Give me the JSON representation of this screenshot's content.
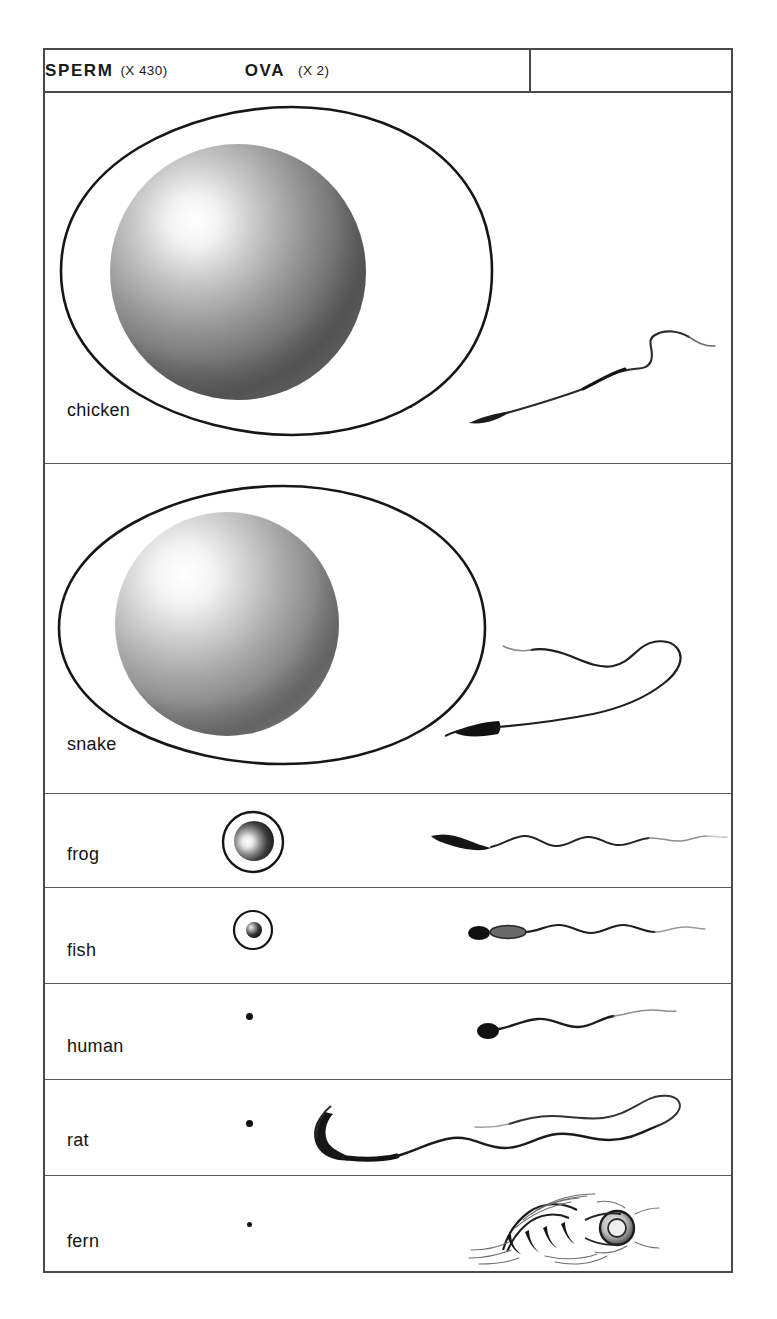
{
  "plate": {
    "header": {
      "ova": {
        "title": "OVA",
        "magnification": "(X 2)",
        "x_symbol": "X",
        "mag_value": "2"
      },
      "sperm": {
        "title": "SPERM",
        "magnification": "(X 430)",
        "x_symbol": "X",
        "mag_value": "430"
      }
    },
    "annotations": {
      "chicken_actual_size": "X 1"
    },
    "rows": [
      {
        "label": "chicken",
        "ovum_type": "egg-outline-with-yolk",
        "sperm_type": "wavy-long-tail"
      },
      {
        "label": "snake",
        "ovum_type": "egg-outline-with-yolk",
        "sperm_type": "looping-long-tail"
      },
      {
        "label": "frog",
        "ovum_type": "small-circle-with-sphere",
        "sperm_type": "curved-head-sinusoidal-tail"
      },
      {
        "label": "fish",
        "ovum_type": "tiny-circle-with-sphere",
        "sperm_type": "head-midpiece-wavy-tail"
      },
      {
        "label": "human",
        "ovum_type": "dot",
        "sperm_type": "oval-head-wavy-tail"
      },
      {
        "label": "rat",
        "ovum_type": "dot",
        "sperm_type": "hooked-head-long-wavy-tail"
      },
      {
        "label": "fern",
        "ovum_type": "dot",
        "sperm_type": "coiled-spiral-with-cilia"
      }
    ]
  },
  "colors": {
    "border": "#4a4a4a",
    "ink": "#141414",
    "paper": "#ffffff"
  }
}
